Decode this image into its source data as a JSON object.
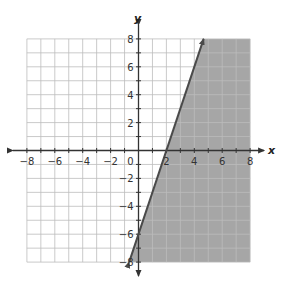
{
  "chart_data": {
    "type": "line",
    "title": "",
    "xlabel": "x",
    "ylabel": "y",
    "xlim": [
      -8,
      8
    ],
    "ylim": [
      -8,
      8
    ],
    "grid": true,
    "grid_step": 1,
    "x_ticks": [
      -8,
      -6,
      -4,
      -2,
      0,
      2,
      4,
      6,
      8
    ],
    "y_ticks": [
      -8,
      -6,
      -4,
      -2,
      2,
      4,
      6,
      8
    ],
    "x_tick_labels": [
      "−8",
      "−6",
      "−4",
      "−2",
      "0",
      "2",
      "4",
      "6",
      "8"
    ],
    "y_tick_labels": [
      "−8",
      "−6",
      "−4",
      "−2",
      "2",
      "4",
      "6",
      "8"
    ],
    "series": [
      {
        "name": "boundary line",
        "equation": "y = 3x − 6",
        "style": "solid",
        "points": [
          [
            -0.67,
            -8
          ],
          [
            0,
            -6
          ],
          [
            2,
            0
          ],
          [
            4.67,
            8
          ]
        ],
        "arrows": true
      }
    ],
    "shaded_region": {
      "description": "region to the right of / below the line",
      "inequality": "y ≤ 3x − 6",
      "color": "#a6a6a6"
    }
  },
  "labels": {
    "x_axis": "x",
    "y_axis": "y",
    "origin": "0"
  },
  "colors": {
    "shade": "#a6a6a6",
    "line": "#4a4a4a",
    "grid": "#bdbdbd",
    "axis": "#333333"
  }
}
